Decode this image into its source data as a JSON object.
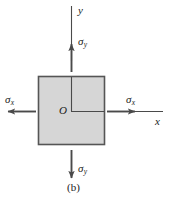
{
  "figure": {
    "caption": "(b)",
    "background_color": "#ffffff",
    "line_color": "#4a4a4a",
    "text_color": "#1a1a1a"
  },
  "element": {
    "name": "stress-element-square",
    "fill_color": "#d6d6d6",
    "stroke_color": "#555555",
    "origin_label": "O"
  },
  "axes": [
    {
      "name": "y-axis",
      "label": "y",
      "direction": "up"
    },
    {
      "name": "x-axis",
      "label": "x",
      "direction": "right"
    }
  ],
  "stresses": [
    {
      "name": "sigma-y-top",
      "symbol": "σ",
      "subscript": "y",
      "direction": "up",
      "face": "top",
      "sense": "tension"
    },
    {
      "name": "sigma-y-bottom",
      "symbol": "σ",
      "subscript": "y",
      "direction": "down",
      "face": "bottom",
      "sense": "tension"
    },
    {
      "name": "sigma-x-left",
      "symbol": "σ",
      "subscript": "x",
      "direction": "left",
      "face": "left",
      "sense": "tension"
    },
    {
      "name": "sigma-x-right",
      "symbol": "σ",
      "subscript": "x",
      "direction": "right",
      "face": "right",
      "sense": "tension"
    }
  ]
}
